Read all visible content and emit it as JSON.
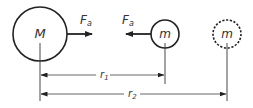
{
  "diagram": {
    "type": "gravitational-attraction",
    "colors": {
      "stroke": "#222222",
      "thin_stroke": "#555555",
      "text": "#333333",
      "background": "#ffffff"
    },
    "bodies": [
      {
        "id": "large-mass",
        "label": "M",
        "style": "solid",
        "cx": 40,
        "cy": 34,
        "r": 27
      },
      {
        "id": "small-mass",
        "label": "m",
        "style": "solid",
        "cx": 165,
        "cy": 34,
        "r": 14
      },
      {
        "id": "small-mass-far",
        "label": "m",
        "style": "dashed",
        "cx": 227,
        "cy": 34,
        "r": 14
      }
    ],
    "forces": [
      {
        "id": "force-on-M",
        "label_main": "F",
        "label_sub": "a",
        "direction": "right"
      },
      {
        "id": "force-on-m",
        "label_main": "F",
        "label_sub": "a",
        "direction": "left"
      }
    ],
    "distances": [
      {
        "id": "r1",
        "label_main": "r",
        "label_sub": "1",
        "from": "M",
        "to": "m"
      },
      {
        "id": "r2",
        "label_main": "r",
        "label_sub": "2",
        "from": "M",
        "to": "m (dashed)"
      }
    ]
  }
}
